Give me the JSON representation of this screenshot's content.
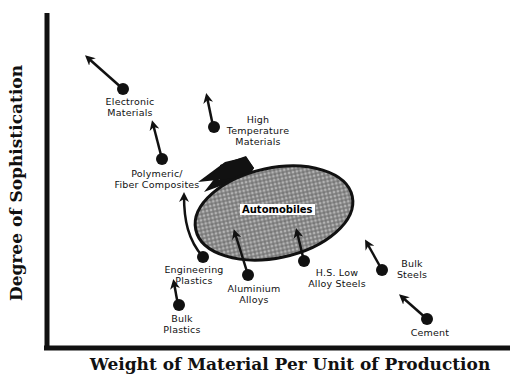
{
  "diagram": {
    "title": "",
    "axes": {
      "y_label": "Degree of Sophistication",
      "x_label": "Weight of Material Per Unit of Production"
    },
    "center": {
      "label": "Automobiles"
    },
    "materials": [
      {
        "id": "electronic",
        "line1": "Electronic",
        "line2": "Materials",
        "line3": ""
      },
      {
        "id": "high-temp",
        "line1": "High",
        "line2": "Temperature",
        "line3": "Materials"
      },
      {
        "id": "polymeric",
        "line1": "Polymeric/",
        "line2": "Fiber Composites",
        "line3": ""
      },
      {
        "id": "engineering-plastics",
        "line1": "Engineering",
        "line2": "Plastics",
        "line3": ""
      },
      {
        "id": "bulk-plastics",
        "line1": "Bulk",
        "line2": "Plastics",
        "line3": ""
      },
      {
        "id": "aluminium",
        "line1": "Aluminium",
        "line2": "Alloys",
        "line3": ""
      },
      {
        "id": "hsla",
        "line1": "H.S. Low",
        "line2": "Alloy Steels",
        "line3": ""
      },
      {
        "id": "bulk-steels",
        "line1": "Bulk",
        "line2": "Steels",
        "line3": ""
      },
      {
        "id": "cement",
        "line1": "Cement",
        "line2": "",
        "line3": ""
      }
    ]
  }
}
